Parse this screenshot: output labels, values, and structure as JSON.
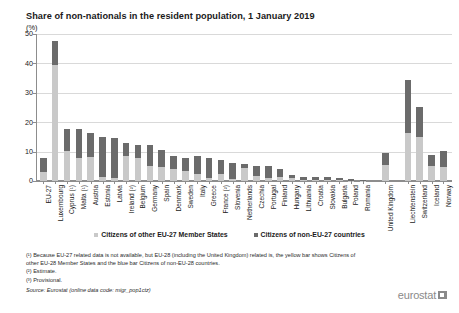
{
  "title": "Share of non-nationals in the resident population, 1 January 2019",
  "y_unit": "(%)",
  "legend": {
    "items": [
      {
        "label": "Citizens of other EU-27 Member States",
        "color": "#c9c9c9",
        "key": "eu27"
      },
      {
        "label": "Citizens of non-EU-27 countries",
        "color": "#6b6b6b",
        "key": "noneu27"
      }
    ]
  },
  "footnotes": {
    "note1": "(¹) Because EU-27 related data is not available, but EU-28 (including the United Kingdom) related is, the yellow bar shows Citizens of other EU-28 Member States and the blue bar Citizens of non-EU-28 countries.",
    "note2": "(²) Estimate.",
    "note3": "(³) Provisional.",
    "source": "Source: Eurostat (online data code: migr_pop1ctz)"
  },
  "logo": {
    "wordmark": "eurostat"
  },
  "chart_data": {
    "type": "bar",
    "subtype": "stacked-column",
    "title": "Share of non-nationals in the resident population, 1 January 2019",
    "xlabel": "",
    "ylabel": "(%)",
    "ylim": [
      0,
      50
    ],
    "yticks": [
      0,
      10,
      20,
      30,
      40,
      50
    ],
    "grid": true,
    "legend_position": "bottom-center",
    "categories": [
      "EU-27",
      "Luxembourg",
      "Cyprus (¹)",
      "Malta (¹)",
      "Austria",
      "Estonia",
      "Latvia",
      "Ireland (²)",
      "Belgium",
      "Germany",
      "Spain",
      "Denmark",
      "Sweden",
      "Italy",
      "Greece",
      "France (²)",
      "Slovenia",
      "Netherlands",
      "Czechia",
      "Portugal",
      "Finland",
      "Hungary",
      "Lithuania",
      "Croatia",
      "Slovakia",
      "Bulgaria",
      "Poland",
      "Romania",
      "United Kingdom",
      "Liechtenstein",
      "Switzerland",
      "Iceland",
      "Norway"
    ],
    "gaps_after": [
      "Romania",
      "United Kingdom"
    ],
    "series": [
      {
        "name": "Citizens of other EU-27 Member States",
        "color": "#c9c9c9",
        "values": [
          3.1,
          39.5,
          10.2,
          7.9,
          8.2,
          1.2,
          1.1,
          8.5,
          7.8,
          5.0,
          4.9,
          4.2,
          3.4,
          2.5,
          1.1,
          2.3,
          0.7,
          4.4,
          1.8,
          0.9,
          1.5,
          1.0,
          0.3,
          0.4,
          0.3,
          0.2,
          0.1,
          0.1,
          5.6,
          16.2,
          15.0,
          5.2,
          4.8
        ]
      },
      {
        "name": "Citizens of non-EU-27 countries",
        "color": "#6b6b6b",
        "values": [
          4.9,
          8.0,
          7.6,
          9.7,
          8.2,
          13.9,
          13.6,
          4.3,
          4.6,
          7.2,
          5.8,
          4.3,
          4.6,
          6.0,
          6.8,
          4.7,
          5.6,
          1.3,
          3.2,
          4.2,
          2.5,
          1.0,
          1.2,
          0.9,
          0.9,
          0.9,
          0.6,
          0.3,
          3.9,
          18.3,
          10.3,
          3.6,
          5.5
        ]
      }
    ],
    "totals": [
      8.0,
      47.5,
      17.8,
      17.6,
      16.4,
      15.1,
      14.7,
      12.8,
      12.4,
      12.2,
      10.7,
      8.5,
      8.0,
      8.5,
      7.9,
      7.0,
      6.3,
      5.7,
      5.0,
      5.1,
      4.0,
      2.0,
      1.5,
      1.3,
      1.2,
      1.1,
      0.7,
      0.4,
      9.5,
      34.5,
      25.3,
      8.8,
      10.3
    ]
  }
}
